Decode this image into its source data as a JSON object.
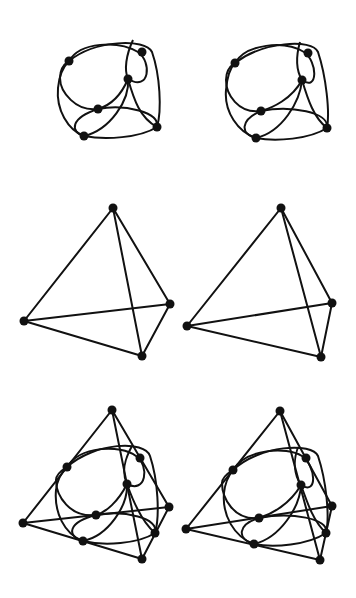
{
  "colors": {
    "stroke": "#111111",
    "background": "#ffffff"
  },
  "vertex_radius": 4.5,
  "figures": [
    {
      "name": "sphere-figure-left",
      "kind": "sphere",
      "offset": [
        0,
        0
      ],
      "curves": [
        "M69,61 C80,42 118,40 138,52 C152,62 150,92 128,79",
        "M128,79 C120,98 108,106 98,109 C76,112 60,92 60,78 C60,70 64,64 69,61",
        "M69,61 C95,40 145,38 152,52 C160,75 162,110 157,127",
        "M157,127 C140,138 105,140 84,136 C68,130 56,110 58,88 C59,76 63,67 69,61",
        "M84,136 C70,132 70,118 98,109 C125,104 160,112 157,127",
        "M133,40 C126,55 124,70 128,79 C134,100 140,118 157,127",
        "M128,79 C130,100 110,130 84,136"
      ],
      "vertices": [
        [
          69,
          61
        ],
        [
          142,
          52
        ],
        [
          128,
          79
        ],
        [
          98,
          109
        ],
        [
          84,
          136
        ],
        [
          157,
          127
        ]
      ]
    },
    {
      "name": "sphere-figure-right",
      "kind": "sphere",
      "offset": [
        0,
        0
      ],
      "curves": [
        "M235,63 C246,44 284,40 304,52 C318,62 318,92 302,80",
        "M302,80 C292,99 272,108 261,111 C238,114 226,94 226,80 C226,72 230,66 235,63",
        "M235,63 C262,42 312,38 318,52 C326,76 330,112 327,128",
        "M327,128 C310,139 276,142 256,138 C238,132 224,112 226,90 C227,78 230,68 235,63",
        "M256,138 C240,134 240,120 261,111 C290,105 330,112 327,128",
        "M300,42 C296,56 296,70 302,80 C308,100 314,118 327,128",
        "M302,80 C300,102 282,132 256,138"
      ],
      "vertices": [
        [
          235,
          63
        ],
        [
          308,
          53
        ],
        [
          302,
          80
        ],
        [
          261,
          111
        ],
        [
          256,
          138
        ],
        [
          327,
          128
        ]
      ]
    },
    {
      "name": "tetrahedron-left",
      "kind": "tetrahedron",
      "vertices": [
        [
          113,
          208
        ],
        [
          24,
          321
        ],
        [
          170,
          304
        ],
        [
          142,
          356
        ]
      ],
      "edges": [
        [
          0,
          1
        ],
        [
          0,
          2
        ],
        [
          0,
          3
        ],
        [
          1,
          2
        ],
        [
          1,
          3
        ],
        [
          2,
          3
        ]
      ]
    },
    {
      "name": "tetrahedron-right",
      "kind": "tetrahedron",
      "vertices": [
        [
          281,
          208
        ],
        [
          187,
          326
        ],
        [
          332,
          303
        ],
        [
          321,
          357
        ]
      ],
      "edges": [
        [
          0,
          1
        ],
        [
          0,
          2
        ],
        [
          0,
          3
        ],
        [
          1,
          2
        ],
        [
          1,
          3
        ],
        [
          2,
          3
        ]
      ]
    },
    {
      "name": "combined-figure-left",
      "kind": "tetrahedron-with-sphere",
      "vertices": [
        [
          112,
          410
        ],
        [
          23,
          523
        ],
        [
          169,
          507
        ],
        [
          142,
          559
        ]
      ],
      "edges": [
        [
          0,
          1
        ],
        [
          0,
          2
        ],
        [
          0,
          3
        ],
        [
          1,
          2
        ],
        [
          1,
          3
        ],
        [
          2,
          3
        ]
      ],
      "curves": [
        "M67,467 C80,446 120,444 136,456 C150,466 146,494 127,484",
        "M127,484 C118,502 106,512 96,515 C70,518 56,496 56,480 C56,474 62,470 67,467",
        "M67,467 C95,442 145,440 150,456 C158,480 160,516 155,533",
        "M155,533 C138,544 104,546 83,541 C64,534 54,512 56,490 C57,480 62,472 67,467",
        "M83,541 C66,536 68,522 96,515 C124,510 160,518 155,533",
        "M132,446 C124,460 122,474 127,484 C134,504 142,522 155,533",
        "M127,484 C128,506 108,536 83,541"
      ],
      "sphere_vertices": [
        [
          67,
          467
        ],
        [
          140,
          458
        ],
        [
          127,
          484
        ],
        [
          96,
          515
        ],
        [
          83,
          541
        ],
        [
          155,
          533
        ]
      ]
    },
    {
      "name": "combined-figure-right",
      "kind": "tetrahedron-with-sphere",
      "vertices": [
        [
          280,
          411
        ],
        [
          186,
          529
        ],
        [
          332,
          506
        ],
        [
          320,
          560
        ]
      ],
      "edges": [
        [
          0,
          1
        ],
        [
          0,
          2
        ],
        [
          0,
          3
        ],
        [
          1,
          2
        ],
        [
          1,
          3
        ],
        [
          2,
          3
        ]
      ],
      "curves": [
        "M233,470 C246,449 286,446 302,456 C316,466 318,496 301,485",
        "M301,485 C290,504 272,514 259,518 C234,521 222,498 222,483 C222,477 228,473 233,470",
        "M233,470 C260,445 312,442 318,456 C326,480 330,516 326,533",
        "M326,533 C308,545 274,548 254,544 C234,537 222,515 224,493 C225,483 229,475 233,470",
        "M254,544 C236,539 238,524 259,518 C290,512 330,518 326,533",
        "M298,447 C293,461 294,475 301,485 C308,505 314,522 326,533",
        "M301,485 C300,507 280,538 254,544"
      ],
      "sphere_vertices": [
        [
          233,
          470
        ],
        [
          306,
          458
        ],
        [
          301,
          485
        ],
        [
          259,
          518
        ],
        [
          254,
          544
        ],
        [
          326,
          533
        ]
      ]
    }
  ]
}
